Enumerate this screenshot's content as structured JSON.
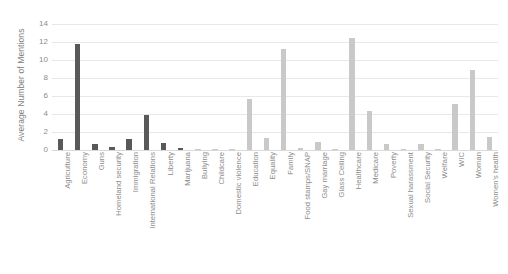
{
  "chart_data": {
    "type": "bar",
    "title": "",
    "xlabel": "",
    "ylabel": "Average Number of Mentions",
    "ylim": [
      0,
      14
    ],
    "ytick_values": [
      0,
      2,
      4,
      6,
      8,
      10,
      12,
      14
    ],
    "ytick_labels": [
      "0",
      "2",
      "4",
      "6",
      "8",
      "10",
      "12",
      "14"
    ],
    "grid": true,
    "legend": "none",
    "categories": [
      "Agriculture",
      "Economy",
      "Guns",
      "Homeland security",
      "Immigration",
      "International Relations",
      "Liberty",
      "Marijuana",
      "Bullying",
      "Childcare",
      "Domestic violence",
      "Education",
      "Equality",
      "Family",
      "Food stamps/SNAP",
      "Gay marriage",
      "Glass Ceiling",
      "Healthcare",
      "Medicare",
      "Poverty",
      "Sexual harassment",
      "Social Security",
      "Welfare",
      "WIC",
      "Woman",
      "Women's health"
    ],
    "values": [
      1.2,
      11.8,
      0.65,
      0.35,
      1.2,
      3.9,
      0.8,
      0.25,
      0.1,
      0.15,
      0.15,
      5.7,
      1.35,
      11.2,
      0.2,
      0.9,
      0.1,
      12.5,
      4.3,
      0.7,
      0.05,
      0.7,
      0.1,
      5.1,
      8.9,
      1.5
    ],
    "bar_colors": [
      "#595959",
      "#595959",
      "#595959",
      "#595959",
      "#595959",
      "#595959",
      "#595959",
      "#595959",
      "#c9c9c9",
      "#c9c9c9",
      "#c9c9c9",
      "#c9c9c9",
      "#c9c9c9",
      "#c9c9c9",
      "#c9c9c9",
      "#c9c9c9",
      "#c9c9c9",
      "#c9c9c9",
      "#c9c9c9",
      "#c9c9c9",
      "#c9c9c9",
      "#c9c9c9",
      "#c9c9c9",
      "#c9c9c9",
      "#c9c9c9",
      "#c9c9c9"
    ],
    "colors": {
      "dark_series": "#595959",
      "light_series": "#c9c9c9",
      "gridline": "#e8e8e8",
      "axis_text": "#8c8c8c",
      "background": "#ffffff"
    }
  }
}
